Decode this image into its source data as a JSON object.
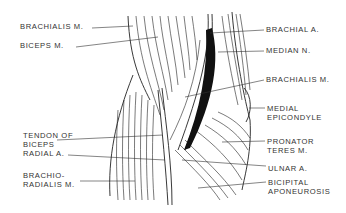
{
  "figure": {
    "labels_left": [
      {
        "id": "brachialis-left",
        "text": "BRACHIALIS M.",
        "x": 20,
        "y": 26
      },
      {
        "id": "biceps",
        "text": "BICEPS M.",
        "x": 20,
        "y": 45
      },
      {
        "id": "tendon-biceps-1",
        "text": "TENDON OF",
        "x": 23,
        "y": 135
      },
      {
        "id": "tendon-biceps-2",
        "text": "BICEPS",
        "x": 23,
        "y": 144
      },
      {
        "id": "radial-a",
        "text": "RADIAL A.",
        "x": 23,
        "y": 153
      },
      {
        "id": "brachioradialis-1",
        "text": "BRACHIO-",
        "x": 23,
        "y": 175
      },
      {
        "id": "brachioradialis-2",
        "text": "RADIALIS M.",
        "x": 23,
        "y": 184
      }
    ],
    "labels_right": [
      {
        "id": "brachial-a",
        "text": "BRACHIAL  A.",
        "x": 266,
        "y": 27
      },
      {
        "id": "median-n",
        "text": "MEDIAN N.",
        "x": 266,
        "y": 48
      },
      {
        "id": "brachialis-right",
        "text": "BRACHIALIS M.",
        "x": 266,
        "y": 76
      },
      {
        "id": "medial-epicondyle-1",
        "text": "MEDIAL",
        "x": 267,
        "y": 104
      },
      {
        "id": "medial-epicondyle-2",
        "text": "EPICONDYLE",
        "x": 267,
        "y": 113
      },
      {
        "id": "pronator-teres-1",
        "text": "PRONATOR",
        "x": 267,
        "y": 136
      },
      {
        "id": "pronator-teres-2",
        "text": "TERES M.",
        "x": 267,
        "y": 145
      },
      {
        "id": "ulnar-a",
        "text": "ULNAR  A.",
        "x": 268,
        "y": 163
      },
      {
        "id": "bicipital-aponeurosis-1",
        "text": "BICIPITAL",
        "x": 268,
        "y": 178
      },
      {
        "id": "bicipital-aponeurosis-2",
        "text": "APONEUROSIS",
        "x": 268,
        "y": 187
      }
    ]
  }
}
